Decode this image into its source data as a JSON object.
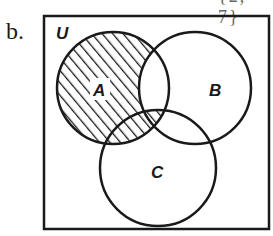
{
  "part_label": "b.",
  "cropped_top_text": "{2, 7}",
  "diagram": {
    "type": "venn",
    "universe_label": "U",
    "sets": [
      {
        "name": "A",
        "label": "A"
      },
      {
        "name": "B",
        "label": "B"
      },
      {
        "name": "C",
        "label": "C"
      }
    ],
    "shaded_region": "A ∩ (B′ ∪ C)",
    "shaded_regions_description": [
      "A only",
      "A ∩ C only",
      "A ∩ B ∩ C"
    ],
    "unshaded_regions_description": [
      "A ∩ B only",
      "B only",
      "C only",
      "B ∩ C only",
      "outside all sets"
    ],
    "stroke_color": "#1a1a1a",
    "background_color": "#ffffff"
  }
}
